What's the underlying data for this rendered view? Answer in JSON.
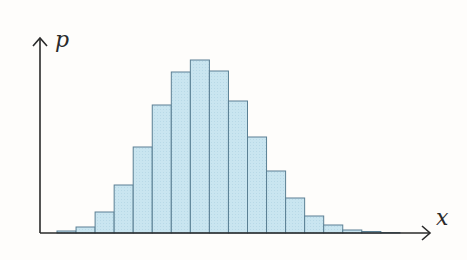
{
  "chart_data": {
    "type": "bar",
    "title": "",
    "xlabel": "x",
    "ylabel": "p",
    "categories": [
      "1",
      "2",
      "3",
      "4",
      "5",
      "6",
      "7",
      "8",
      "9",
      "10",
      "11",
      "12",
      "13",
      "14",
      "15",
      "16",
      "17",
      "18"
    ],
    "values": [
      2,
      6,
      21,
      48,
      86,
      128,
      161,
      173,
      162,
      132,
      96,
      62,
      35,
      17,
      8,
      3,
      1.5,
      0.5
    ],
    "ylim": [
      0,
      190
    ],
    "grid": false,
    "legend": null,
    "bar_fill": "#c7e4ef",
    "bar_edge": "#5a7f93",
    "axis_color": "#2a2a2a"
  },
  "axes": {
    "x_label": "x",
    "y_label": "p"
  }
}
